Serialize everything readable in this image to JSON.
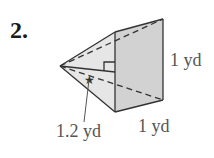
{
  "problem": {
    "number": "2.",
    "figure": "square pyramid",
    "labels": {
      "height": "1 yd",
      "base_edge": "1 yd",
      "slant_height": "1.2 yd"
    }
  },
  "colors": {
    "face_light": "#e4e4e4",
    "face_front": "#cfcfcf",
    "stroke": "#333333",
    "text": "#555555"
  }
}
